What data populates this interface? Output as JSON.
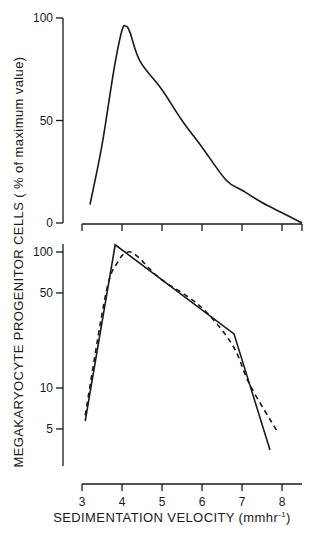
{
  "chart_data": [
    {
      "type": "line",
      "panel": "top",
      "title": "",
      "xlabel": "SEDIMENTATION VELOCITY (mmhr-1)",
      "ylabel": "MEGAKARYOCYTE PROGENITOR CELLS ( % of maximum value)",
      "xlim": [
        3,
        8.5
      ],
      "ylim": [
        0,
        100
      ],
      "yscale": "linear",
      "x_ticks": [
        3,
        4,
        5,
        6,
        7,
        8
      ],
      "y_ticks": [
        0,
        50,
        100
      ],
      "y_tick_labels": [
        "0",
        "50",
        "100"
      ],
      "grid": false,
      "series": [
        {
          "name": "distribution",
          "style": "solid",
          "x": [
            3.2,
            3.5,
            3.8,
            4.0,
            4.1,
            4.2,
            4.45,
            5.0,
            5.5,
            6.0,
            6.6,
            7.0,
            7.5,
            8.0,
            8.5
          ],
          "y": [
            9,
            38,
            75,
            94,
            96,
            93,
            79,
            65,
            50,
            37,
            21,
            16,
            10,
            5,
            0
          ]
        }
      ]
    },
    {
      "type": "line",
      "panel": "bottom",
      "title": "",
      "xlabel": "SEDIMENTATION VELOCITY (mmhr-1)",
      "ylabel": "MEGAKARYOCYTE PROGENITOR CELLS ( % of maximum value)",
      "xlim": [
        3,
        8.5
      ],
      "ylim": [
        2.5,
        120
      ],
      "yscale": "log",
      "x_ticks": [
        3,
        4,
        5,
        6,
        7,
        8
      ],
      "x_tick_labels": [
        "3",
        "4",
        "5",
        "6",
        "7",
        "8"
      ],
      "y_ticks": [
        5,
        10,
        50,
        100
      ],
      "y_tick_labels": [
        "5",
        "10",
        "50",
        "100"
      ],
      "grid": false,
      "series": [
        {
          "name": "solid",
          "style": "solid",
          "x": [
            3.08,
            3.83,
            6.8,
            7.7
          ],
          "y": [
            5.7,
            113,
            25,
            3.5
          ]
        },
        {
          "name": "dashed",
          "style": "dashed",
          "x": [
            3.08,
            3.6,
            3.9,
            4.15,
            4.4,
            4.95,
            5.95,
            6.75,
            7.2,
            7.9
          ],
          "y": [
            6.3,
            50,
            85,
            100,
            92,
            64,
            40,
            21,
            10.5,
            4.7
          ]
        }
      ]
    }
  ],
  "labels": {
    "ylabel": "MEGAKARYOCYTE  PROGENITOR  CELLS  ( % of maximum value)",
    "xlabel_main": "SEDIMENTATION  VELOCITY  (mmhr",
    "xlabel_sup": "-1",
    "xlabel_close": ")"
  }
}
